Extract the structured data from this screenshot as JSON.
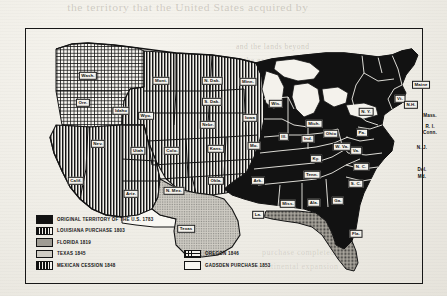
{
  "document": {
    "kind": "scanned-historical-map",
    "title": "Territorial Expansion of the United States"
  },
  "bleed_through": {
    "top_line": "the territory that the United States acquired by",
    "right_line_1": "and the lands beyond",
    "right_line_2": "the great river were",
    "right_line_3": "still unexplored then",
    "mid_line_1": "the boundary of the",
    "mid_line_2": "western claim lands",
    "bottom_line_1": "purchase completed the",
    "bottom_line_2": "continental expansion"
  },
  "legend": {
    "rows": [
      [
        {
          "label": "ORIGINAL TERRITORY OF THE U.S. 1783",
          "pattern": "solid",
          "name": "original-territory"
        }
      ],
      [
        {
          "label": "LOUISIANA PURCHASE 1803",
          "pattern": "vstripe",
          "name": "louisiana-purchase"
        }
      ],
      [
        {
          "label": "FLORIDA 1819",
          "pattern": "stipple-dark",
          "name": "florida"
        }
      ],
      [
        {
          "label": "TEXAS 1845",
          "pattern": "stipple",
          "name": "texas"
        },
        {
          "label": "OREGON 1846",
          "pattern": "cross",
          "name": "oregon"
        }
      ],
      [
        {
          "label": "MEXICAN CESSION 1848",
          "pattern": "vstripe",
          "name": "mexican-cession"
        },
        {
          "label": "GADSDEN PURCHASE 1853",
          "pattern": "white",
          "name": "gadsden-purchase"
        }
      ]
    ]
  },
  "map_labels": [
    {
      "text": "Wash.",
      "x": 62,
      "y": 47,
      "plate": true
    },
    {
      "text": "Ore.",
      "x": 57,
      "y": 74,
      "plate": true
    },
    {
      "text": "Idaho",
      "x": 95,
      "y": 82,
      "plate": true
    },
    {
      "text": "Mont.",
      "x": 135,
      "y": 52,
      "plate": true
    },
    {
      "text": "N. Dak.",
      "x": 186,
      "y": 52,
      "plate": true
    },
    {
      "text": "S. Dak.",
      "x": 186,
      "y": 73,
      "plate": true
    },
    {
      "text": "Minn.",
      "x": 222,
      "y": 53,
      "plate": true
    },
    {
      "text": "Wyo.",
      "x": 120,
      "y": 87,
      "plate": true
    },
    {
      "text": "Nebr.",
      "x": 182,
      "y": 96,
      "plate": true
    },
    {
      "text": "Iowa",
      "x": 224,
      "y": 89,
      "plate": true
    },
    {
      "text": "Nev.",
      "x": 72,
      "y": 115,
      "plate": true
    },
    {
      "text": "Utah",
      "x": 112,
      "y": 122,
      "plate": true
    },
    {
      "text": "Colo.",
      "x": 146,
      "y": 122,
      "plate": true
    },
    {
      "text": "Kans.",
      "x": 190,
      "y": 120,
      "plate": true
    },
    {
      "text": "Mo.",
      "x": 228,
      "y": 117,
      "plate": true
    },
    {
      "text": "Calif.",
      "x": 50,
      "y": 152,
      "plate": true
    },
    {
      "text": "Ariz.",
      "x": 105,
      "y": 165,
      "plate": true
    },
    {
      "text": "N. Mex.",
      "x": 148,
      "y": 162,
      "plate": true
    },
    {
      "text": "Okla.",
      "x": 190,
      "y": 152,
      "plate": true
    },
    {
      "text": "Ark.",
      "x": 232,
      "y": 152,
      "plate": true
    },
    {
      "text": "Texas",
      "x": 160,
      "y": 200,
      "plate": true
    },
    {
      "text": "La.",
      "x": 232,
      "y": 186,
      "plate": true
    },
    {
      "text": "Wis.",
      "x": 250,
      "y": 75,
      "plate": true
    },
    {
      "text": "Mich.",
      "x": 288,
      "y": 95,
      "plate": true
    },
    {
      "text": "Ill.",
      "x": 258,
      "y": 108,
      "plate": true
    },
    {
      "text": "Ind.",
      "x": 282,
      "y": 110,
      "plate": true
    },
    {
      "text": "Ohio",
      "x": 305,
      "y": 105,
      "plate": true
    },
    {
      "text": "Ky.",
      "x": 290,
      "y": 130,
      "plate": true
    },
    {
      "text": "Tenn.",
      "x": 286,
      "y": 146,
      "plate": true
    },
    {
      "text": "Miss.",
      "x": 262,
      "y": 175,
      "plate": true
    },
    {
      "text": "Ala.",
      "x": 288,
      "y": 174,
      "plate": true
    },
    {
      "text": "Ga.",
      "x": 312,
      "y": 172,
      "plate": true
    },
    {
      "text": "Fla.",
      "x": 330,
      "y": 205,
      "plate": true
    },
    {
      "text": "S. C.",
      "x": 330,
      "y": 155,
      "plate": true
    },
    {
      "text": "N. C.",
      "x": 335,
      "y": 138,
      "plate": true
    },
    {
      "text": "Va.",
      "x": 330,
      "y": 122,
      "plate": true
    },
    {
      "text": "W. Va.",
      "x": 316,
      "y": 118,
      "plate": true
    },
    {
      "text": "Pa.",
      "x": 336,
      "y": 104,
      "plate": true
    },
    {
      "text": "N. Y.",
      "x": 340,
      "y": 83,
      "plate": true
    },
    {
      "text": "Vt.",
      "x": 374,
      "y": 70,
      "plate": true
    },
    {
      "text": "N.H.",
      "x": 385,
      "y": 76,
      "plate": true
    },
    {
      "text": "Maine",
      "x": 395,
      "y": 56,
      "plate": true
    },
    {
      "text": "Mass.",
      "x": 404,
      "y": 86,
      "plate": false
    },
    {
      "text": "R. I.",
      "x": 404,
      "y": 97,
      "plate": false
    },
    {
      "text": "Conn.",
      "x": 404,
      "y": 103,
      "plate": false
    },
    {
      "text": "N. J.",
      "x": 396,
      "y": 118,
      "plate": false
    },
    {
      "text": "Del.",
      "x": 396,
      "y": 140,
      "plate": false
    },
    {
      "text": "Md.",
      "x": 396,
      "y": 147,
      "plate": false
    }
  ],
  "colors": {
    "ink": "#111111",
    "paper": "#f1efe9",
    "plate_bg": "#f4f2ec",
    "stipple_texas": "#cfccc4",
    "stipple_florida": "#b9b5ab"
  }
}
